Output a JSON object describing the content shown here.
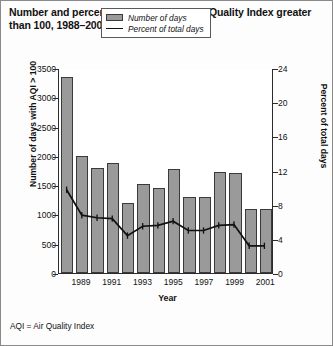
{
  "title": "Number and percentage of days with Air Quality Index greater than 100, 1988–2001",
  "footnote": "AQI = Air Quality Index",
  "legend": {
    "items": [
      {
        "label": "Number of days",
        "marker": "bar-swatch",
        "color": "#9a9a9a"
      },
      {
        "label": "Percent of total days",
        "marker": "line-swatch",
        "color": "#111111"
      }
    ]
  },
  "chart_data": {
    "type": "bar",
    "title": "Number and percentage of days with Air Quality Index greater than 100, 1988–2001",
    "xlabel": "Year",
    "ylabel": "Number of days with AQI > 100",
    "y2label": "Percent of total days",
    "categories": [
      "1988",
      "1989",
      "1990",
      "1991",
      "1992",
      "1993",
      "1994",
      "1995",
      "1996",
      "1997",
      "1998",
      "1999",
      "2000",
      "2001"
    ],
    "x_tick_labels": [
      "",
      "1989",
      "",
      "1991",
      "",
      "1993",
      "",
      "1995",
      "",
      "1997",
      "",
      "1999",
      "",
      "2001"
    ],
    "ylim": [
      0,
      3500
    ],
    "y_ticks": [
      0,
      500,
      1000,
      1500,
      2000,
      2500,
      3000,
      3500
    ],
    "y2lim": [
      0,
      24
    ],
    "y2_ticks": [
      0,
      4,
      8,
      12,
      16,
      20,
      24
    ],
    "grid": false,
    "legend_position": "top-center",
    "series": [
      {
        "name": "Number of days",
        "type": "bar",
        "axis": "left",
        "color": "#9a9a9a",
        "values": [
          3350,
          2000,
          1800,
          1880,
          1200,
          1520,
          1450,
          1780,
          1300,
          1300,
          1720,
          1700,
          1100,
          1100
        ]
      },
      {
        "name": "Percent of total days",
        "type": "line",
        "axis": "right",
        "color": "#111111",
        "values": [
          9.8,
          6.8,
          6.5,
          6.4,
          4.4,
          5.5,
          5.6,
          6.1,
          5.0,
          5.0,
          5.6,
          5.7,
          3.2,
          3.2
        ]
      }
    ]
  }
}
